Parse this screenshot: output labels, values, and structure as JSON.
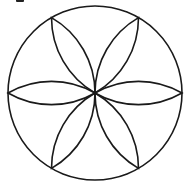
{
  "diagram": {
    "type": "geometric-figure",
    "circle": {
      "cx": 95,
      "cy": 93,
      "r": 87
    },
    "petal_count": 6,
    "petal_angles_deg": [
      0,
      60,
      120,
      180,
      240,
      300
    ],
    "stroke_color": "#1a1a1a",
    "background_color": "#ffffff"
  }
}
